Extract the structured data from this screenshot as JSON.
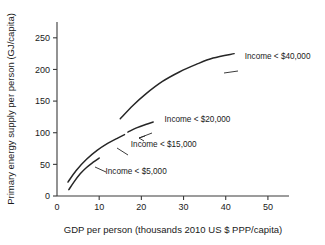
{
  "chart_data": {
    "type": "line",
    "title": "",
    "xlabel": "GDP per person (thousands 2010 US $ PPP/capita)",
    "ylabel": "Primary energy supply per person (GJ/capita)",
    "xlim": [
      0,
      55
    ],
    "ylim": [
      0,
      275
    ],
    "xticks": [
      "0",
      "10",
      "20",
      "30",
      "40",
      "50"
    ],
    "xtick_values": [
      0,
      10,
      20,
      30,
      40,
      50
    ],
    "yticks": [
      "0",
      "50",
      "100",
      "150",
      "200",
      "250"
    ],
    "ytick_values": [
      0,
      50,
      100,
      150,
      200,
      250
    ],
    "grid": false,
    "legend_position": "inline-annotations",
    "line_color": "#262626",
    "series": [
      {
        "name": "Income < $5,000",
        "label": "Income < $5,000",
        "points": [
          [
            2.8,
            10
          ],
          [
            4.0,
            22
          ],
          [
            5.5,
            35
          ],
          [
            7.0,
            45
          ],
          [
            8.5,
            53
          ],
          [
            10.0,
            60
          ]
        ]
      },
      {
        "name": "Income < $15,000",
        "label": "Income < $15,000",
        "points": [
          [
            2.6,
            22
          ],
          [
            4.5,
            40
          ],
          [
            7.0,
            58
          ],
          [
            9.5,
            72
          ],
          [
            12.0,
            83
          ],
          [
            14.5,
            92
          ],
          [
            16.0,
            97
          ]
        ]
      },
      {
        "name": "Income < $20,000",
        "label": "Income < $20,000",
        "points": [
          [
            16.8,
            101
          ],
          [
            19.0,
            108
          ],
          [
            21.0,
            113
          ],
          [
            22.8,
            117
          ]
        ]
      },
      {
        "name": "Income < $40,000",
        "label": "Income < $40,000",
        "points": [
          [
            15.0,
            122
          ],
          [
            18.0,
            143
          ],
          [
            21.0,
            161
          ],
          [
            25.0,
            181
          ],
          [
            29.0,
            196
          ],
          [
            33.0,
            208
          ],
          [
            37.0,
            218
          ],
          [
            42.0,
            225
          ]
        ]
      }
    ],
    "annotations": [
      {
        "text": "Income < $40,000",
        "x": 44.5,
        "y": 222
      },
      {
        "text": "Income < $20,000",
        "x": 25.5,
        "y": 122
      },
      {
        "text": "Income < $15,000",
        "x": 17.5,
        "y": 82
      },
      {
        "text": "Income < $5,000",
        "x": 11.5,
        "y": 40
      }
    ]
  }
}
